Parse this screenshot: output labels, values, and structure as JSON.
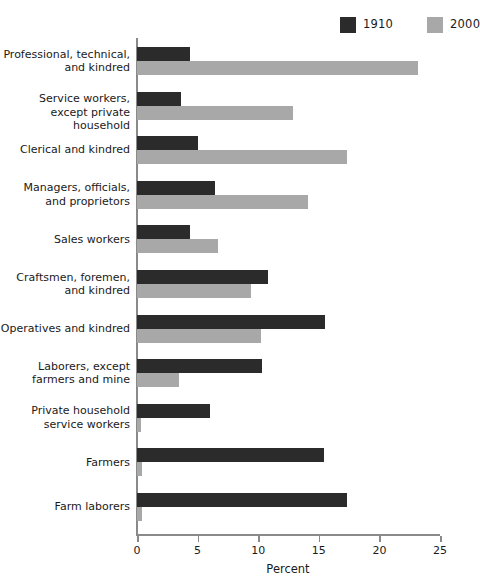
{
  "chart_data": {
    "type": "bar",
    "orientation": "horizontal",
    "title": "",
    "xlabel": "Percent",
    "ylabel": "",
    "xlim": [
      0,
      25
    ],
    "xticks": [
      0,
      5,
      10,
      15,
      20,
      25
    ],
    "grid": false,
    "legend_position": "top-right",
    "categories": [
      "Professional, technical,\nand kindred",
      "Service workers,\nexcept private household",
      "Clerical and kindred",
      "Managers, officials,\nand proprietors",
      "Sales workers",
      "Craftsmen, foremen,\nand kindred",
      "Operatives and kindred",
      "Laborers, except\nfarmers and mine",
      "Private household\nservice workers",
      "Farmers",
      "Farm laborers"
    ],
    "series": [
      {
        "name": "1910",
        "color": "#2b2b2b",
        "values": [
          4.4,
          3.6,
          5.0,
          6.4,
          4.4,
          10.8,
          15.5,
          10.3,
          6.0,
          15.4,
          17.3
        ]
      },
      {
        "name": "2000",
        "color": "#a8a8a8",
        "values": [
          23.2,
          12.9,
          17.3,
          14.1,
          6.7,
          9.4,
          10.2,
          3.5,
          0.3,
          0.4,
          0.4
        ]
      }
    ]
  },
  "axis": {
    "tick_labels": [
      "0",
      "5",
      "10",
      "15",
      "20",
      "25"
    ],
    "x_axis_title": "Percent"
  },
  "legend": {
    "entries": [
      {
        "label": "1910",
        "swatch": "dark-swatch-icon"
      },
      {
        "label": "2000",
        "swatch": "gray-swatch-icon"
      }
    ]
  },
  "colors": {
    "series_1910": "#2b2b2b",
    "series_2000": "#a8a8a8",
    "axis": "#8a8a8a",
    "text": "#1a1a1a",
    "background": "#ffffff"
  }
}
